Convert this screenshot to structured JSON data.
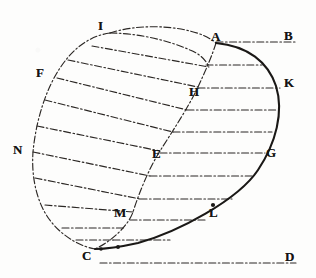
{
  "figure": {
    "kind": "geometry-diagram",
    "ink_color": "#1a1816",
    "dash_color": "#2b2724",
    "paper_color": "#fdfdfc",
    "solid_curve_width": 2.1,
    "dash_curve_width": 1.15,
    "dash_pattern": "7 2.5 1.6 2.5",
    "point_labels": [
      {
        "id": "A",
        "text": "A",
        "x": 211,
        "y": 30,
        "px": 216,
        "py": 43
      },
      {
        "id": "B",
        "text": "B",
        "x": 284,
        "y": 29,
        "px": 290,
        "py": 42
      },
      {
        "id": "I",
        "text": "I",
        "x": 98,
        "y": 19,
        "px": 110,
        "py": 33
      },
      {
        "id": "K",
        "text": "K",
        "x": 284,
        "y": 76,
        "px": 279,
        "py": 90
      },
      {
        "id": "F",
        "text": "F",
        "x": 36,
        "y": 66,
        "px": 57,
        "py": 78
      },
      {
        "id": "H",
        "text": "H",
        "x": 189,
        "y": 85,
        "px": 198,
        "py": 86
      },
      {
        "id": "N",
        "text": "N",
        "x": 13,
        "y": 143,
        "px": 33,
        "py": 153
      },
      {
        "id": "E",
        "text": "E",
        "x": 152,
        "y": 147,
        "px": 160,
        "py": 150
      },
      {
        "id": "G",
        "text": "G",
        "x": 266,
        "y": 146,
        "px": 259,
        "py": 155
      },
      {
        "id": "M",
        "text": "M",
        "x": 114,
        "y": 206,
        "px": 133,
        "py": 212
      },
      {
        "id": "L",
        "text": "L",
        "x": 209,
        "y": 206,
        "px": 213,
        "py": 203
      },
      {
        "id": "C",
        "text": "C",
        "x": 82,
        "y": 249,
        "px": 95,
        "py": 249
      },
      {
        "id": "D",
        "text": "D",
        "x": 285,
        "y": 250,
        "px": 291,
        "py": 263
      }
    ],
    "paths": {
      "solid_curve": "M 216,43 C 248,46 268,62 276,86 C 284,112 276,143 258,170 C 238,200 178,232 138,243 C 120,247 104,249 95,249",
      "outer_arc": "M 110,33 C 88,36 72,50 60,68 C 46,89 36,120 33,152 C 31,180 38,207 53,224 C 66,239 83,247 95,249",
      "inner_arc": "M 216,43 C 212,56 205,72 198,87 C 188,108 172,132 160,151 C 148,170 138,196 133,212 C 128,226 112,241 95,249",
      "top_arc": "M 110,33 C 134,25 166,25 190,31 C 202,34 210,38 216,43",
      "top_arc_inner": "M 110,33 C 136,33 168,40 190,50 C 200,54 206,60 209,67",
      "horizontals": [
        {
          "y": 42,
          "x1": 216,
          "x2": 295
        },
        {
          "y": 65,
          "x1": 206,
          "x2": 262
        },
        {
          "y": 88,
          "x1": 198,
          "x2": 280
        },
        {
          "y": 110,
          "x1": 187,
          "x2": 277
        },
        {
          "y": 132,
          "x1": 173,
          "x2": 272
        },
        {
          "y": 153,
          "x1": 160,
          "x2": 265
        },
        {
          "y": 176,
          "x1": 150,
          "x2": 253
        },
        {
          "y": 199,
          "x1": 140,
          "x2": 232
        },
        {
          "y": 220,
          "x1": 130,
          "x2": 205
        },
        {
          "y": 240,
          "x1": 113,
          "x2": 170
        },
        {
          "y": 263,
          "x1": 100,
          "x2": 296
        }
      ],
      "obliques": [
        {
          "x1": 92,
          "y1": 46,
          "x2": 209,
          "y2": 67
        },
        {
          "x1": 68,
          "y1": 60,
          "x2": 198,
          "y2": 87
        },
        {
          "x1": 57,
          "y1": 78,
          "x2": 187,
          "y2": 110
        },
        {
          "x1": 45,
          "y1": 100,
          "x2": 173,
          "y2": 132
        },
        {
          "x1": 37,
          "y1": 126,
          "x2": 160,
          "y2": 151
        },
        {
          "x1": 33,
          "y1": 152,
          "x2": 150,
          "y2": 176
        },
        {
          "x1": 35,
          "y1": 178,
          "x2": 140,
          "y2": 199
        },
        {
          "x1": 45,
          "y1": 205,
          "x2": 133,
          "y2": 212
        },
        {
          "x1": 62,
          "y1": 228,
          "x2": 125,
          "y2": 228
        },
        {
          "x1": 76,
          "y1": 240,
          "x2": 113,
          "y2": 240
        }
      ],
      "tick_marks": [
        {
          "x": 213,
          "y": 205,
          "r": 2.1
        },
        {
          "x": 118,
          "y": 247,
          "r": 2.0
        },
        {
          "x": 101,
          "y": 249,
          "r": 1.8
        }
      ]
    }
  }
}
